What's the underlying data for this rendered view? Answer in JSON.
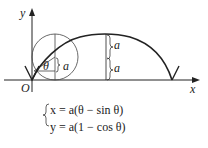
{
  "diagram": {
    "axes": {
      "x_label": "x",
      "y_label": "y",
      "origin_label": "O"
    },
    "labels": {
      "angle": "θ",
      "radius_small": "a",
      "height_upper": "a",
      "height_lower": "a"
    },
    "equations": {
      "line1": "x = a(θ − sin θ)",
      "line2": "y = a(1 − cos θ)"
    },
    "colors": {
      "stroke": "#222222",
      "background": "#ffffff"
    }
  }
}
